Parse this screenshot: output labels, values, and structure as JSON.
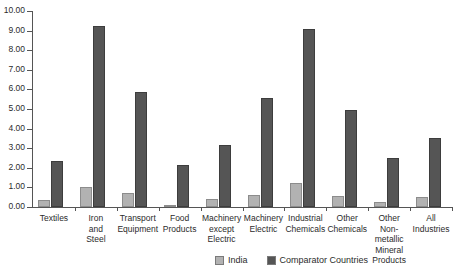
{
  "chart_data": {
    "type": "bar",
    "title": "",
    "xlabel": "",
    "ylabel": "",
    "ylim": [
      0,
      10
    ],
    "ytick_step": 1,
    "grid": false,
    "legend_position": "bottom",
    "categories": [
      "Textiles",
      "Iron and Steel",
      "Transport Equipment",
      "Food Products",
      "Machinery except Electric",
      "Machinery Electric",
      "Industrial Chemicals",
      "Other Chemicals",
      "Other Non-metallic Mineral Products",
      "All Industries"
    ],
    "category_label_lines": [
      [
        "Textiles"
      ],
      [
        "Iron",
        "and",
        "Steel"
      ],
      [
        "Transport",
        "Equipment"
      ],
      [
        "Food",
        "Products"
      ],
      [
        "Machinery",
        "except",
        "Electric"
      ],
      [
        "Machinery",
        "Electric"
      ],
      [
        "Industrial",
        "Chemicals"
      ],
      [
        "Other",
        "Chemicals"
      ],
      [
        "Other",
        "Non-",
        "metallic",
        "Mineral",
        "Products"
      ],
      [
        "All",
        "Industries"
      ]
    ],
    "ytick_labels": [
      "0.00",
      "1.00",
      "2.00",
      "3.00",
      "4.00",
      "5.00",
      "6.00",
      "7.00",
      "8.00",
      "9.00",
      "10.00"
    ],
    "series": [
      {
        "name": "India",
        "color": "#b2b2b2",
        "values": [
          0.35,
          1.0,
          0.7,
          0.05,
          0.4,
          0.6,
          1.2,
          0.55,
          0.25,
          0.5
        ]
      },
      {
        "name": "Comparator Countries",
        "color": "#555555",
        "values": [
          2.35,
          9.25,
          5.85,
          2.15,
          3.15,
          5.55,
          9.1,
          4.95,
          2.5,
          3.5
        ]
      }
    ]
  },
  "legend": {
    "items": [
      {
        "label": "India",
        "color": "#b2b2b2"
      },
      {
        "label": "Comparator Countries",
        "color": "#555555"
      }
    ]
  }
}
